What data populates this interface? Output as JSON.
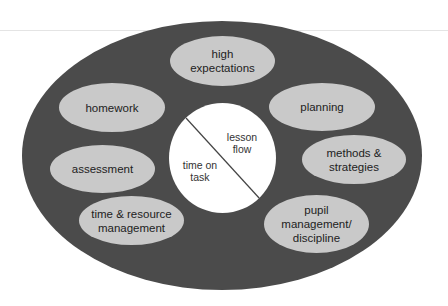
{
  "diagram": {
    "type": "nested-ellipse concept diagram",
    "colors": {
      "outer_fill": "#4b4b4b",
      "oval_fill": "#c9c9c9",
      "center_fill": "#ffffff",
      "text": "#222222"
    },
    "center": {
      "divider": "diagonal line",
      "left_label": "time on\ntask",
      "right_label": "lesson\nflow"
    },
    "ovals": [
      {
        "id": "high-expectations",
        "label": "high\nexpectations"
      },
      {
        "id": "homework",
        "label": "homework"
      },
      {
        "id": "planning",
        "label": "planning"
      },
      {
        "id": "assessment",
        "label": "assessment"
      },
      {
        "id": "methods-strategies",
        "label": "methods &\nstrategies"
      },
      {
        "id": "time-resource-management",
        "label": "time & resource\nmanagement"
      },
      {
        "id": "pupil-management-discipline",
        "label": "pupil\nmanagement/\ndiscipline"
      }
    ]
  }
}
